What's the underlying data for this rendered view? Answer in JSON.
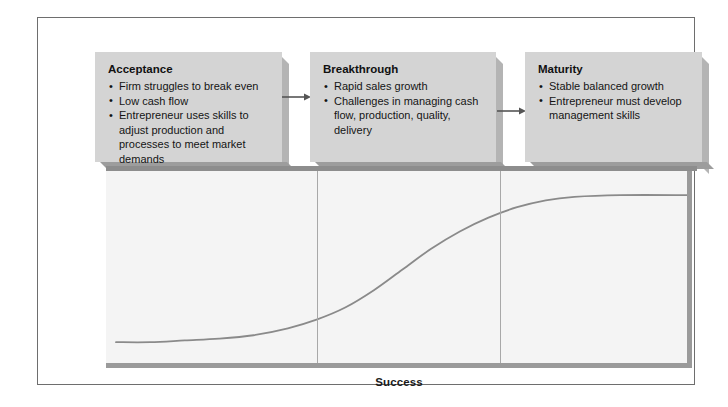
{
  "figure": {
    "type": "business-growth-stage-diagram",
    "axis_label": "Success",
    "colors": {
      "frame_border": "#6e6e6e",
      "box_fill": "#d4d4d4",
      "box_shadow_right": "#b4b4b4",
      "box_shadow_bottom": "#9d9d9d",
      "plot_background": "#f4f4f4",
      "plot_bevel": "#9a9a9a",
      "curve": "#8a8a8a",
      "divider": "#a8a8a8",
      "text": "#141414"
    }
  },
  "stages": [
    {
      "id": "acceptance",
      "title": "Acceptance",
      "bullets": [
        "Firm struggles to break even",
        "Low cash flow",
        "Entrepreneur uses skills to adjust production and processes to meet market demands"
      ]
    },
    {
      "id": "breakthrough",
      "title": "Breakthrough",
      "bullets": [
        "Rapid sales growth",
        "Challenges in managing cash flow, production, quality, delivery"
      ]
    },
    {
      "id": "maturity",
      "title": "Maturity",
      "bullets": [
        "Stable balanced growth",
        "Entrepreneur must develop management skills"
      ]
    }
  ],
  "connectors": [
    {
      "id": "arrow-acceptance-to-breakthrough",
      "from": "acceptance",
      "to": "breakthrough"
    },
    {
      "id": "arrow-breakthrough-to-maturity",
      "from": "breakthrough",
      "to": "maturity"
    }
  ],
  "chart_data": {
    "type": "line",
    "title": "",
    "xlabel": "Success",
    "ylabel": "",
    "grid": false,
    "legend": null,
    "xlim": [
      0,
      100
    ],
    "ylim": [
      0,
      100
    ],
    "series": [
      {
        "name": "Growth S-curve",
        "x": [
          0,
          6,
          12,
          18,
          24,
          30,
          35,
          40,
          45,
          50,
          55,
          60,
          65,
          70,
          75,
          80,
          88,
          100
        ],
        "y": [
          8,
          8,
          9,
          10,
          12,
          16,
          21,
          28,
          38,
          50,
          62,
          72,
          80,
          86,
          90,
          92,
          93,
          93
        ]
      }
    ],
    "vertical_dividers": [
      {
        "label": "Acceptance / Breakthrough boundary",
        "x": 35
      },
      {
        "label": "Breakthrough / Maturity boundary",
        "x": 67
      }
    ],
    "annotations": []
  }
}
